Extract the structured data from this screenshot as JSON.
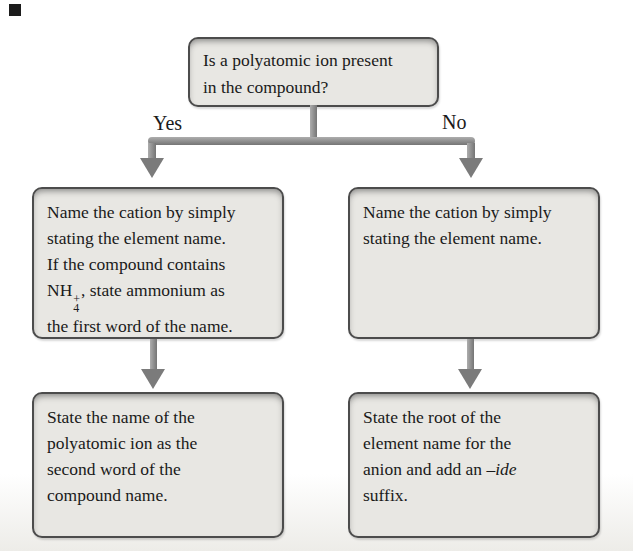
{
  "figure": {
    "decision": {
      "lines": [
        "Is a polyatomic ion present",
        "in the compound?"
      ]
    },
    "branches": {
      "yes_label": "Yes",
      "no_label": "No"
    },
    "boxes": {
      "yes_step1": {
        "lines_top": [
          "Name the cation by simply",
          "stating the element name.",
          "If the compound contains"
        ],
        "formula": {
          "base": "NH",
          "subscript": "4",
          "superscript": "+"
        },
        "formula_line_after": ", state ammonium as",
        "last_line": "the first word of the name."
      },
      "no_step1": {
        "lines": [
          "Name the cation by simply",
          "stating the element name."
        ]
      },
      "yes_step2": {
        "lines": [
          "State the name of the",
          "polyatomic ion as the",
          "second word of the",
          "compound name."
        ]
      },
      "no_step2": {
        "lines_top": [
          "State the root of the",
          "element name for the"
        ],
        "suffix_line_before": "anion and add an ",
        "suffix_italic": "–ide",
        "last_line": "suffix."
      }
    },
    "colors": {
      "background": "#ffffff",
      "box_fill": "#e8e7e3",
      "box_border": "#4c4c4c",
      "arrow_gray": "#8a8a8a",
      "text": "#1a1a1a"
    }
  }
}
